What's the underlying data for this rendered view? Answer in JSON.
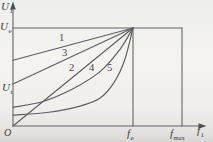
{
  "labels": {
    "y_axis": {
      "base": "U",
      "sub": "1"
    },
    "ue_tick": {
      "base": "U",
      "sub": "e"
    },
    "ut_tick": {
      "base": "U",
      "sub": "t"
    },
    "origin": "O",
    "fe_tick": {
      "base": "f",
      "sub": "e"
    },
    "fmax_tick": {
      "base": "f",
      "sub": "max"
    },
    "x_axis": {
      "base": "f",
      "sub": "1"
    },
    "curves": {
      "c1": "1",
      "c2": "2",
      "c3": "3",
      "c4": "4",
      "c5": "5"
    }
  },
  "colors": {
    "frame": "#63656a",
    "curve": "#5c5e62",
    "arrow": "#4c4e52",
    "text": "#3c3d3f",
    "paper": "#f2f1ed"
  },
  "chart_data": {
    "type": "line",
    "title": "",
    "xlabel": "f1",
    "ylabel": "U1",
    "x_unit": "normalized to fe (fe = 1)",
    "y_unit": "normalized to Ue (Ue = 1)",
    "xlim": [
      0,
      1.45
    ],
    "ylim": [
      0,
      1.18
    ],
    "grid": false,
    "legend_position": "inline-numbers-on-curves",
    "x_ticks": [
      {
        "label": "fe",
        "value": 1.0
      },
      {
        "label": "fmax",
        "value": 1.41
      }
    ],
    "y_ticks": [
      {
        "label": "Ut",
        "value": 0.42
      },
      {
        "label": "Ue",
        "value": 1.0
      }
    ],
    "annotations": [
      "all five curves converge at point (fe, Ue)",
      "horizontal line at Ue spans from U-axis to fmax",
      "vertical reference lines drop from Ue level at fe and fmax",
      "voltage is constant at Ue for frequencies between fe and fmax"
    ],
    "series": [
      {
        "name": "1",
        "shape": "linear",
        "points": [
          [
            0,
            0.67
          ],
          [
            1,
            1
          ]
        ]
      },
      {
        "name": "3",
        "shape": "linear",
        "points": [
          [
            0,
            0.43
          ],
          [
            1,
            1
          ]
        ]
      },
      {
        "name": "2",
        "shape": "linear",
        "points": [
          [
            0,
            0
          ],
          [
            1,
            1
          ]
        ]
      },
      {
        "name": "4",
        "shape": "concave",
        "points": [
          [
            0,
            0.19
          ],
          [
            0.25,
            0.25
          ],
          [
            0.5,
            0.38
          ],
          [
            0.73,
            0.56
          ],
          [
            0.89,
            0.78
          ],
          [
            1,
            1
          ]
        ]
      },
      {
        "name": "5",
        "shape": "concave",
        "points": [
          [
            0,
            0.11
          ],
          [
            0.3,
            0.14
          ],
          [
            0.55,
            0.2
          ],
          [
            0.72,
            0.28
          ],
          [
            0.84,
            0.44
          ],
          [
            0.93,
            0.67
          ],
          [
            1,
            1
          ]
        ]
      }
    ]
  }
}
